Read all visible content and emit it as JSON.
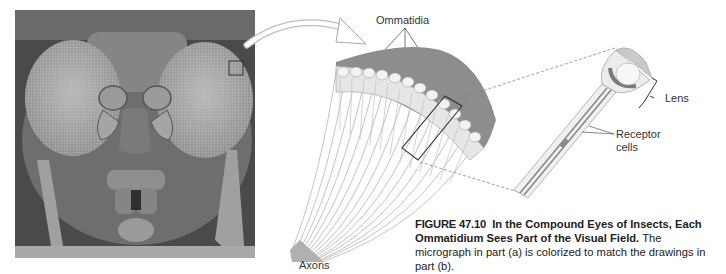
{
  "figure": {
    "number": "FIGURE 47.10",
    "title": "In the Compound Eyes of Insects, Each Ommatidium Sees Part of the Visual Field.",
    "caption_body": "The micrograph in part (a) is colorized to match the drawings in part (b)."
  },
  "panel_a": {
    "description": "Scanning electron micrograph of insect head with compound eyes",
    "highlight_box": "small square on right eye edge"
  },
  "panel_b": {
    "labels": {
      "ommatidia": "Ommatidia",
      "axons": "Axons",
      "lens": "Lens",
      "receptor_line1": "Receptor",
      "receptor_line2": "cells"
    }
  },
  "colors": {
    "background": "#ffffff",
    "micrograph_dark": "#3a3a3a",
    "micrograph_mid": "#8a8a8a",
    "diagram_gray": "#9a9a9a",
    "text": "#222222"
  }
}
